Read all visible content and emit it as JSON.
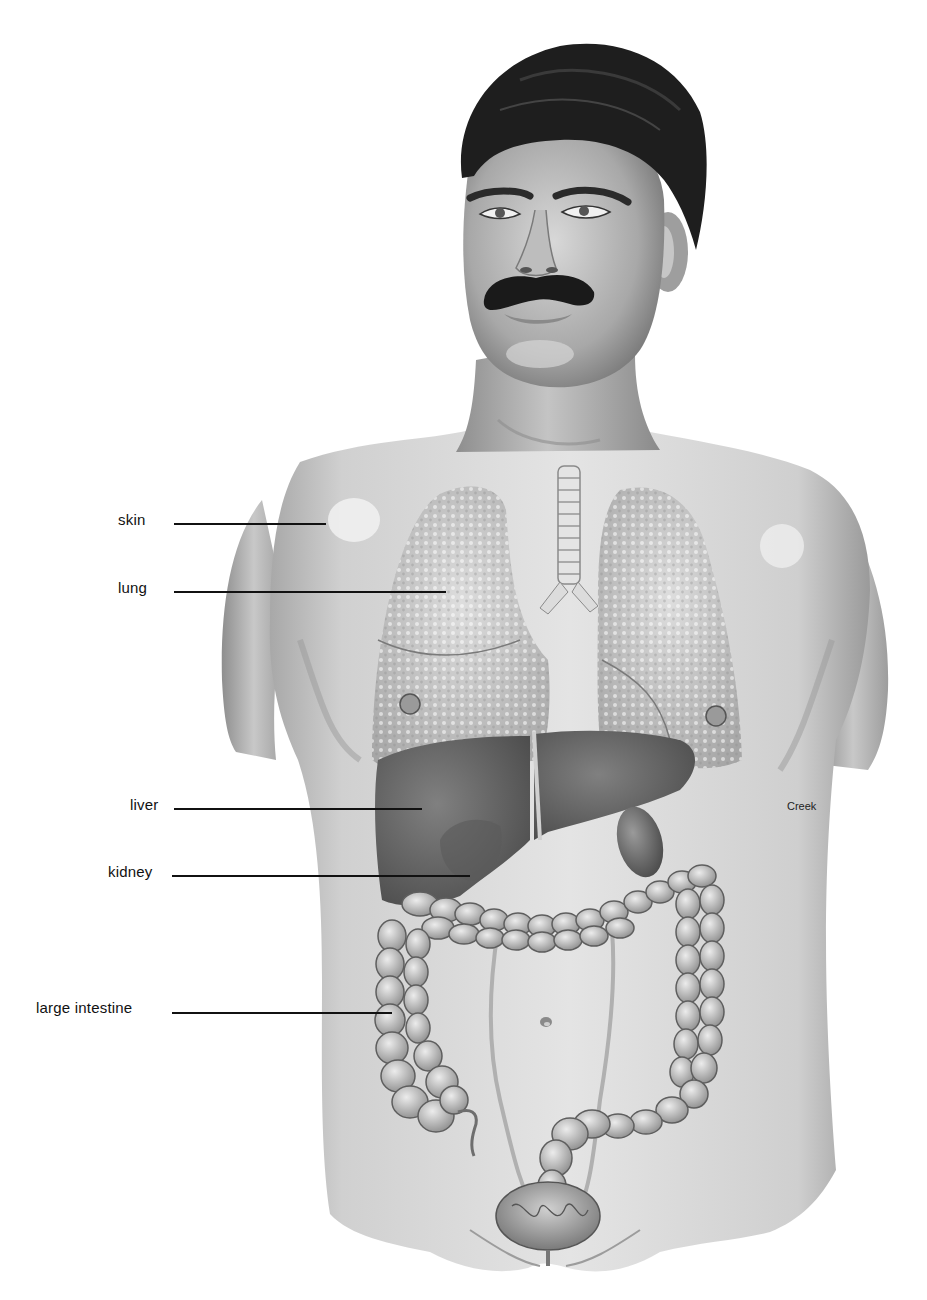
{
  "figure": {
    "style": "grayscale pencil/airbrush rendering"
  },
  "labels": [
    {
      "id": "skin",
      "text": "skin",
      "text_x": 118,
      "text_y": 512,
      "line_x1": 174,
      "line_x2": 326,
      "line_y": 524
    },
    {
      "id": "lung",
      "text": "lung",
      "text_x": 118,
      "text_y": 580,
      "line_x1": 174,
      "line_x2": 446,
      "line_y": 592
    },
    {
      "id": "liver",
      "text": "liver",
      "text_x": 130,
      "text_y": 797,
      "line_x1": 174,
      "line_x2": 422,
      "line_y": 809
    },
    {
      "id": "kidney",
      "text": "kidney",
      "text_x": 108,
      "text_y": 864,
      "line_x1": 172,
      "line_x2": 470,
      "line_y": 876
    },
    {
      "id": "large-intestine",
      "text": "large intestine",
      "text_x": 36,
      "text_y": 1000,
      "line_x1": 172,
      "line_x2": 392,
      "line_y": 1013
    }
  ],
  "signature": {
    "text": "Creek",
    "x": 787,
    "y": 800
  },
  "colors": {
    "background": "#ffffff",
    "skin_light": "#e6e6e6",
    "skin_mid": "#bdbdbd",
    "skin_shadow": "#8a8a8a",
    "hair": "#1c1c1c",
    "lung": "#c9c9c9",
    "liver": "#6e6e6e",
    "intestine": "#a9a9a9",
    "label_text": "#111111"
  }
}
